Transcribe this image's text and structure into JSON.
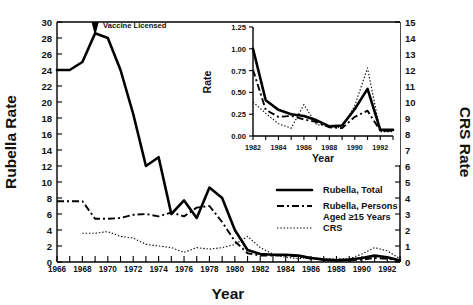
{
  "figure": {
    "caption_title": "Rubella and CRS Rates, United States",
    "annotation": {
      "text": "Vaccine Licensed",
      "year": 1969
    }
  },
  "main_axes": {
    "y_left_label": "Rubella Rate",
    "y_right_label": "CRS Rate",
    "x_label": "Year",
    "y_left_ticks": [
      "0",
      "2",
      "4",
      "6",
      "8",
      "10",
      "12",
      "14",
      "16",
      "18",
      "20",
      "22",
      "24",
      "26",
      "28",
      "30"
    ],
    "y_right_ticks": [
      "0",
      "1",
      "2",
      "3",
      "4",
      "5",
      "6",
      "7",
      "8",
      "9",
      "10",
      "11",
      "12",
      "13",
      "14",
      "15"
    ],
    "x_ticks": [
      "1966",
      "1968",
      "1970",
      "1972",
      "1974",
      "1976",
      "1978",
      "1980",
      "1982",
      "1984",
      "1986",
      "1988",
      "1990",
      "1992"
    ]
  },
  "inset_axes": {
    "y_label": "Rate",
    "x_label": "Year",
    "y_ticks": [
      "0.00",
      "0.25",
      "0.50",
      "0.75",
      "1.00",
      "1.25"
    ],
    "x_ticks": [
      "1982",
      "1984",
      "1986",
      "1988",
      "1990",
      "1992"
    ]
  },
  "legend": {
    "items": [
      {
        "label": "Rubella, Total",
        "style": "solid"
      },
      {
        "label": "Rubella, Persons",
        "label2": "Aged ≥15 Years",
        "style": "dash-dot"
      },
      {
        "label": "CRS",
        "style": "dotted"
      }
    ]
  },
  "chart_data": [
    {
      "type": "line",
      "id": "main",
      "title": "Rubella and CRS Rates, United States, 1966-1993",
      "xlabel": "Year",
      "ylabel": "Rubella Rate",
      "y2label": "CRS Rate",
      "xlim": [
        1966,
        1993
      ],
      "ylim": [
        0,
        30
      ],
      "y2lim": [
        0,
        15
      ],
      "grid": false,
      "legend_position": "lower-right",
      "annotations": [
        {
          "text": "Vaccine Licensed",
          "x": 1969,
          "y": 30
        }
      ],
      "x": [
        1966,
        1967,
        1968,
        1969,
        1970,
        1971,
        1972,
        1973,
        1974,
        1975,
        1976,
        1977,
        1978,
        1979,
        1980,
        1981,
        1982,
        1983,
        1984,
        1985,
        1986,
        1987,
        1988,
        1989,
        1990,
        1991,
        1992,
        1993
      ],
      "series": [
        {
          "name": "Rubella, Total",
          "axis": "left",
          "style": "solid",
          "values": [
            24.0,
            24.0,
            25.0,
            28.6,
            28.0,
            24.0,
            18.5,
            12.0,
            13.1,
            6.0,
            7.7,
            5.5,
            9.3,
            8.0,
            4.0,
            1.5,
            1.0,
            0.9,
            0.9,
            0.8,
            0.5,
            0.3,
            0.2,
            0.3,
            0.5,
            0.8,
            0.6,
            0.2
          ]
        },
        {
          "name": "Rubella, Persons Aged ≥15 Years",
          "axis": "left",
          "style": "dash-dot",
          "values": [
            7.6,
            7.6,
            7.6,
            5.4,
            5.4,
            5.5,
            5.9,
            6.0,
            5.7,
            6.2,
            5.7,
            6.8,
            7.0,
            5.0,
            2.6,
            1.1,
            0.8,
            0.8,
            0.8,
            0.7,
            0.4,
            0.3,
            0.2,
            0.2,
            0.3,
            0.5,
            0.4,
            0.2
          ]
        },
        {
          "name": "CRS",
          "axis": "right",
          "style": "dotted",
          "values": [
            null,
            null,
            1.8,
            1.8,
            1.9,
            1.6,
            1.5,
            1.1,
            1.0,
            0.9,
            0.6,
            0.9,
            0.8,
            0.9,
            1.1,
            1.6,
            0.9,
            0.5,
            0.3,
            0.2,
            0.3,
            0.2,
            0.2,
            0.2,
            0.5,
            0.9,
            0.7,
            0.2
          ]
        }
      ]
    },
    {
      "type": "line",
      "id": "inset",
      "title": "",
      "xlabel": "Year",
      "ylabel": "Rate",
      "xlim": [
        1982,
        1993
      ],
      "ylim": [
        0.0,
        1.25
      ],
      "grid": false,
      "x": [
        1982,
        1983,
        1984,
        1985,
        1986,
        1987,
        1988,
        1989,
        1990,
        1991,
        1992,
        1993
      ],
      "series": [
        {
          "name": "Rubella, Total",
          "style": "solid",
          "values": [
            1.0,
            0.41,
            0.3,
            0.25,
            0.23,
            0.18,
            0.11,
            0.12,
            0.31,
            0.54,
            0.07,
            0.07
          ]
        },
        {
          "name": "Rubella, Persons Aged ≥15 Years",
          "style": "dash-dot",
          "values": [
            0.76,
            0.3,
            0.22,
            0.23,
            0.19,
            0.16,
            0.1,
            0.09,
            0.22,
            0.29,
            0.06,
            0.06
          ]
        },
        {
          "name": "CRS",
          "style": "dotted",
          "values": [
            0.39,
            0.26,
            0.14,
            0.09,
            0.36,
            0.13,
            0.11,
            0.09,
            0.35,
            0.78,
            0.05,
            0.05
          ]
        }
      ]
    }
  ]
}
